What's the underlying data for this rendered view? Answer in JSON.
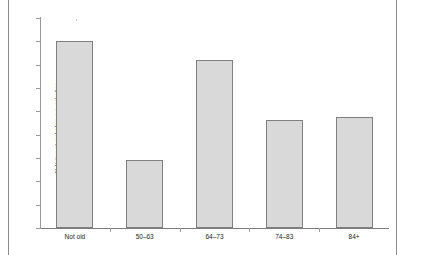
{
  "chart_data": {
    "type": "bar",
    "title": "",
    "subtitle": "",
    "xlabel": "",
    "ylabel": "% living at or below poverty line",
    "categories": [
      "Not old",
      "50–63",
      "64–73",
      "74–83",
      "84+"
    ],
    "values": [
      58.0,
      52.9,
      57.2,
      54.65,
      54.75
    ],
    "series": [
      {
        "name": "% living at or below poverty line",
        "values": [
          58.0,
          52.9,
          57.2,
          54.65,
          54.75
        ]
      }
    ],
    "ylim": [
      50,
      59
    ],
    "ytick_labels": [
      "50",
      "51",
      "52",
      "53",
      "54",
      "55",
      "56",
      "57",
      "58",
      "59"
    ],
    "ytick_values": [
      50,
      51,
      52,
      53,
      54,
      55,
      56,
      57,
      58,
      59
    ],
    "grid": false,
    "legend": false,
    "legend_position": "none",
    "bar_fill_color": "#d9d9d9",
    "bar_border_color": "#7f7f7f",
    "axis_color": "#9a9a9a",
    "background_color": "#ffffff"
  }
}
